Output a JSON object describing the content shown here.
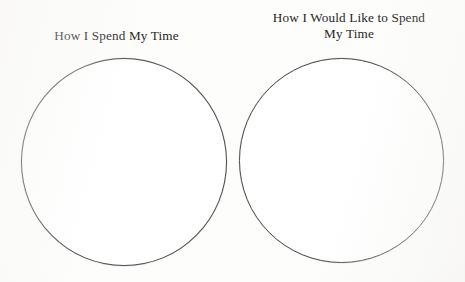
{
  "page": {
    "background_color": "#fdfdfc",
    "ink_color": "#262626",
    "circle_stroke_color": "#4c4c4c",
    "circle_fill_color": "#ffffff"
  },
  "worksheet": {
    "panels": [
      {
        "id": "current",
        "title": "How I Spend My Time",
        "shape": "circle",
        "shape_name": "empty-pie-chart-circle"
      },
      {
        "id": "desired",
        "title": "How I Would Like to Spend\nMy Time",
        "shape": "circle",
        "shape_name": "empty-pie-chart-circle"
      }
    ]
  }
}
